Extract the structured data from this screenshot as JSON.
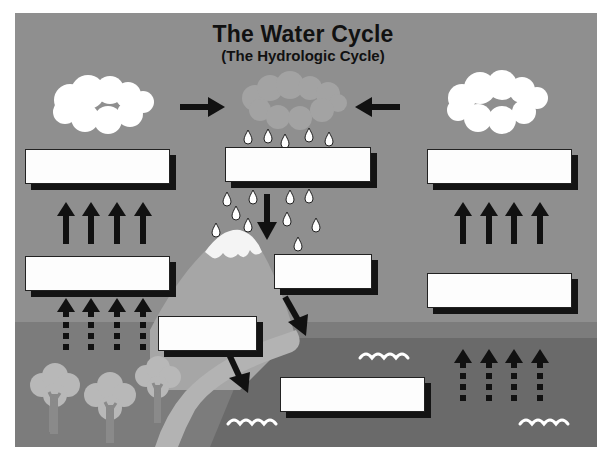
{
  "header": {
    "title": "The Water Cycle",
    "subtitle": "(The Hydrologic Cycle)"
  },
  "colors": {
    "page_background": "#ffffff",
    "sky": "#8f8f8f",
    "ground": "#7c7c7c",
    "sea": "#6a6a6a",
    "mountain": "#a6a6a6",
    "snow": "#f4f4f4",
    "river": "#b3b3b3",
    "rain_cloud": "#a3a3a3",
    "white_cloud": "#ffffff",
    "tree_foliage": "#b8b8b8",
    "tree_trunk": "#8a8a8a",
    "arrows": "#111111",
    "label_box_fill": "#fdfdfd",
    "label_box_shadow": "#141414"
  },
  "label_boxes": [
    {
      "id": "box-left-upper",
      "value": "",
      "placeholder": ""
    },
    {
      "id": "box-center-top",
      "value": "",
      "placeholder": ""
    },
    {
      "id": "box-right-upper",
      "value": "",
      "placeholder": ""
    },
    {
      "id": "box-left-middle",
      "value": "",
      "placeholder": ""
    },
    {
      "id": "box-center-middle",
      "value": "",
      "placeholder": ""
    },
    {
      "id": "box-right-middle",
      "value": "",
      "placeholder": ""
    },
    {
      "id": "box-mountain-lower",
      "value": "",
      "placeholder": ""
    },
    {
      "id": "box-sea",
      "value": "",
      "placeholder": ""
    }
  ],
  "icons": {
    "white_cloud_left": "cloud-icon",
    "rain_cloud_center": "rain-cloud-icon",
    "white_cloud_right": "cloud-icon",
    "raindrops": "raindrop-icon",
    "mountain": "mountain-icon",
    "river": "river-icon",
    "trees": "tree-icon",
    "waves": "wave-icon",
    "solid_up_arrows": "arrow-up-icon",
    "dotted_up_arrows": "dotted-arrow-up-icon",
    "horizontal_arrows": "arrow-right-icon / arrow-left-icon",
    "diagonal_arrows": "arrow-down-right-icon"
  }
}
